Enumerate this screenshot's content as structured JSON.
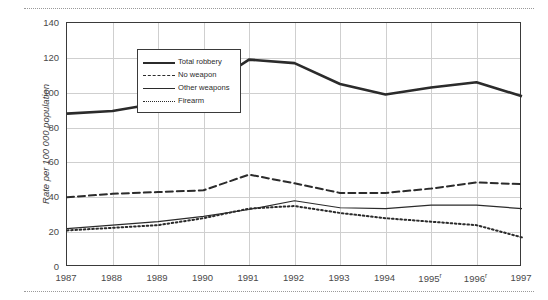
{
  "chart_data": {
    "type": "line",
    "title": "",
    "xlabel": "",
    "ylabel": "Rate per 100 000 population",
    "ylim": [
      0,
      140
    ],
    "yticks": [
      0,
      20,
      40,
      60,
      80,
      100,
      120,
      140
    ],
    "grid": true,
    "legend_position": "top-left inside plot",
    "categories": [
      "1987",
      "1988",
      "1989",
      "1990",
      "1991",
      "1992",
      "1993",
      "1994",
      "1995",
      "1996",
      "1997"
    ],
    "category_labels": [
      "1987",
      "1988",
      "1989",
      "1990",
      "1991",
      "1992",
      "1993",
      "1994",
      "1995ʳ",
      "1996ʳ",
      "1997"
    ],
    "footnote_markers": {
      "1995": "r",
      "1996": "r"
    },
    "series": [
      {
        "name": "Total robbery",
        "style": "solid-thick",
        "color": "#2b2b2b",
        "values": [
          88,
          89.5,
          94,
          102,
          119,
          117,
          105,
          99,
          103,
          106,
          98
        ]
      },
      {
        "name": "No weapon",
        "style": "dashed",
        "color": "#2b2b2b",
        "values": [
          40,
          42,
          43,
          44,
          53,
          48,
          42.5,
          42.5,
          45,
          48.5,
          47.5
        ]
      },
      {
        "name": "Other weapons",
        "style": "solid-thin",
        "color": "#2b2b2b",
        "values": [
          22,
          24,
          26,
          29,
          33,
          38,
          34,
          33.5,
          35.5,
          35.5,
          33.5
        ]
      },
      {
        "name": "Firearm",
        "style": "dotted",
        "color": "#2b2b2b",
        "values": [
          21,
          22.5,
          24,
          28,
          33.5,
          35,
          31,
          28,
          26,
          24,
          17
        ]
      }
    ]
  },
  "colors": {
    "ink": "#2b2b2b",
    "axis": "#3a3a3a",
    "grid": "#cfcfcf",
    "tick_text": "#4a4a4a",
    "background": "#ffffff"
  }
}
